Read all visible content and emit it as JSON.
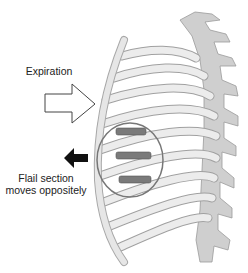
{
  "labels": {
    "expiration": "Expiration",
    "flail_line1": "Flail section",
    "flail_line2": "moves oppositely"
  },
  "colors": {
    "bone": "#e9e9e9",
    "bone_stroke": "#a8a8a8",
    "spine": "#c8c8c8",
    "flail": "#7a7a7a",
    "circle": "#777777",
    "arrow_fill": "#111111"
  }
}
